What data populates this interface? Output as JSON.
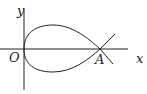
{
  "figure": {
    "type": "curve-diagram",
    "labels": {
      "y_axis": "y",
      "x_axis": "x",
      "origin": "O",
      "point_a": "A"
    },
    "stroke_color": "#222222",
    "background": "#ffffff"
  }
}
